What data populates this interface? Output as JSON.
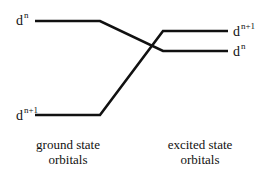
{
  "diagram": {
    "type": "orbital-correlation",
    "line_color": "#111111",
    "ground_state": {
      "levels": [
        {
          "base": "d",
          "superscript": "n",
          "position": "upper"
        },
        {
          "base": "d",
          "superscript": "n+1",
          "position": "lower"
        }
      ],
      "caption_line1": "ground state",
      "caption_line2": "orbitals"
    },
    "excited_state": {
      "levels": [
        {
          "base": "d",
          "superscript": "n+1",
          "position": "upper"
        },
        {
          "base": "d",
          "superscript": "n",
          "position": "lower"
        }
      ],
      "caption_line1": "excited state",
      "caption_line2": "orbitals"
    },
    "connections": [
      {
        "from": "ground d^n (upper)",
        "to": "excited d^n (lower)"
      },
      {
        "from": "ground d^n+1 (lower)",
        "to": "excited d^n+1 (upper)"
      }
    ]
  }
}
